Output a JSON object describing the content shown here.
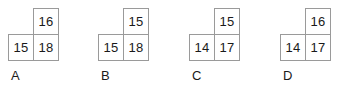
{
  "canvas": {
    "width": 357,
    "height": 93,
    "background": "#ffffff",
    "border_color": "#9a9a9a",
    "text_color": "#1a1a1a"
  },
  "question": {
    "type": "multiple-choice-figure-options",
    "option_count": 4
  },
  "options": [
    {
      "label": "A",
      "left": 8,
      "figure_top": 8,
      "label_left": 11,
      "label_top": 68,
      "cells": {
        "top_right": "16",
        "bottom_left": "15",
        "bottom_right": "18"
      }
    },
    {
      "label": "B",
      "left": 98,
      "figure_top": 8,
      "label_left": 101,
      "label_top": 68,
      "cells": {
        "top_right": "15",
        "bottom_left": "15",
        "bottom_right": "18"
      }
    },
    {
      "label": "C",
      "left": 189,
      "figure_top": 8,
      "label_left": 192,
      "label_top": 68,
      "cells": {
        "top_right": "15",
        "bottom_left": "14",
        "bottom_right": "17"
      }
    },
    {
      "label": "D",
      "left": 280,
      "figure_top": 8,
      "label_left": 283,
      "label_top": 68,
      "cells": {
        "top_right": "16",
        "bottom_left": "14",
        "bottom_right": "17"
      }
    }
  ]
}
